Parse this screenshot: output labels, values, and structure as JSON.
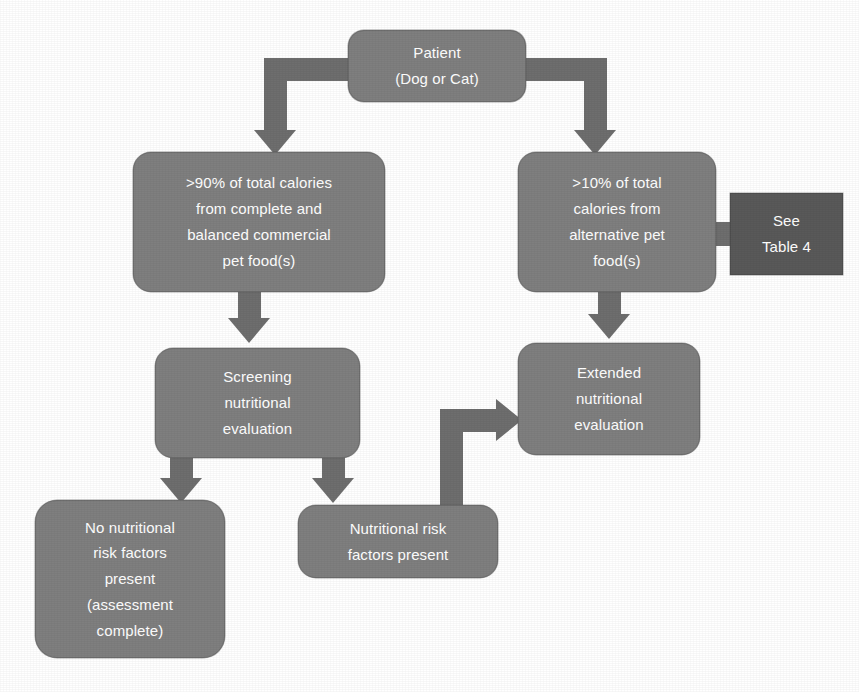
{
  "diagram": {
    "colors": {
      "node_fill": "#7f7f7f",
      "node_dark_fill": "#595959",
      "connector": "#6e6e6e",
      "node_text": "#ffffff",
      "background": "#ffffff"
    },
    "nodes": {
      "patient": {
        "id": "patient",
        "shape": "rounded-rectangle",
        "lines": [
          "Patient",
          "(Dog or Cat)"
        ]
      },
      "complete_balanced": {
        "id": "complete-balanced",
        "shape": "rounded-rectangle",
        "lines": [
          ">90% of total calories",
          "from complete and",
          "balanced commercial",
          "pet food(s)"
        ]
      },
      "alternative": {
        "id": "alternative-pet-food",
        "shape": "rounded-rectangle",
        "lines": [
          ">10% of total",
          "calories from",
          "alternative pet",
          "food(s)"
        ]
      },
      "see_table": {
        "id": "see-table-4",
        "shape": "rectangle",
        "lines": [
          "See",
          "Table 4"
        ]
      },
      "screening": {
        "id": "screening-evaluation",
        "shape": "rounded-rectangle",
        "lines": [
          "Screening",
          "nutritional",
          "evaluation"
        ]
      },
      "extended": {
        "id": "extended-evaluation",
        "shape": "rounded-rectangle",
        "lines": [
          "Extended",
          "nutritional",
          "evaluation"
        ]
      },
      "no_risk": {
        "id": "no-risk-factors",
        "shape": "rounded-rectangle",
        "lines": [
          "No nutritional",
          "risk factors",
          "present",
          "(assessment",
          "complete)"
        ]
      },
      "risk_present": {
        "id": "risk-factors-present",
        "shape": "rounded-rectangle",
        "lines": [
          "Nutritional risk",
          "factors present"
        ]
      }
    },
    "edges": [
      {
        "from": "patient",
        "to": "complete_balanced",
        "style": "elbow-down-left"
      },
      {
        "from": "patient",
        "to": "alternative",
        "style": "elbow-down-right"
      },
      {
        "from": "complete_balanced",
        "to": "screening",
        "style": "straight-down"
      },
      {
        "from": "alternative",
        "to": "extended",
        "style": "straight-down"
      },
      {
        "from": "see_table",
        "to": "alternative",
        "style": "straight-left"
      },
      {
        "from": "screening",
        "to": "no_risk",
        "style": "straight-down"
      },
      {
        "from": "screening",
        "to": "risk_present",
        "style": "straight-down"
      },
      {
        "from": "risk_present",
        "to": "extended",
        "style": "elbow-up-right"
      }
    ]
  }
}
